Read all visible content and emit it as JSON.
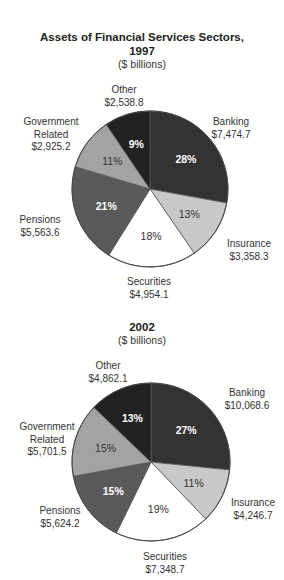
{
  "chart_data": [
    {
      "type": "pie",
      "title": "Assets of Financial Services Sectors, 1997",
      "subtitle": "($ billions)",
      "categories": [
        "Banking",
        "Insurance",
        "Securities",
        "Pensions",
        "Government Related",
        "Other"
      ],
      "values": [
        7474.7,
        3358.3,
        4954.1,
        5563.6,
        2925.2,
        2538.8
      ],
      "value_labels": [
        "$7,474.7",
        "$3,358.3",
        "$4,954.1",
        "$5,563.6",
        "$2,925.2",
        "$2,538.8"
      ],
      "percent_labels": [
        "28%",
        "13%",
        "18%",
        "21%",
        "11%",
        "9%"
      ],
      "colors": [
        "#333333",
        "#c8c8c8",
        "#ffffff",
        "#5a5a5a",
        "#a3a3a3",
        "#222222"
      ]
    },
    {
      "type": "pie",
      "title": "2002",
      "subtitle": "($ billions)",
      "categories": [
        "Banking",
        "Insurance",
        "Securities",
        "Pensions",
        "Government Related",
        "Other"
      ],
      "values": [
        10068.6,
        4246.7,
        7348.7,
        5624.2,
        5701.5,
        4862.1
      ],
      "value_labels": [
        "$10,068.6",
        "$4,246.7",
        "$7,348.7",
        "$5,624.2",
        "$5,701.5",
        "$4,862.1"
      ],
      "percent_labels": [
        "27%",
        "11%",
        "19%",
        "15%",
        "15%",
        "13%"
      ],
      "colors": [
        "#333333",
        "#c8c8c8",
        "#ffffff",
        "#5a5a5a",
        "#a3a3a3",
        "#222222"
      ]
    }
  ],
  "chart1": {
    "title_line1": "Assets of Financial Services Sectors,",
    "title_line2": "1997",
    "subtitle": "($ billions)",
    "labels": {
      "other": {
        "name": "Other",
        "value": "$2,538.8"
      },
      "banking": {
        "name": "Banking",
        "value": "$7,474.7"
      },
      "gov": {
        "name1": "Government",
        "name2": "Related",
        "value": "$2,925.2"
      },
      "pensions": {
        "name": "Pensions",
        "value": "$5,563.6"
      },
      "insurance": {
        "name": "Insurance",
        "value": "$3,358.3"
      },
      "securities": {
        "name": "Securities",
        "value": "$4,954.1"
      }
    },
    "pcts": {
      "banking": "28%",
      "insurance": "13%",
      "securities": "18%",
      "pensions": "21%",
      "gov": "11%",
      "other": "9%"
    }
  },
  "chart2": {
    "title": "2002",
    "subtitle": "($ billions)",
    "labels": {
      "other": {
        "name": "Other",
        "value": "$4,862.1"
      },
      "banking": {
        "name": "Banking",
        "value": "$10,068.6"
      },
      "gov": {
        "name1": "Government",
        "name2": "Related",
        "value": "$5,701.5"
      },
      "pensions": {
        "name": "Pensions",
        "value": "$5,624.2"
      },
      "insurance": {
        "name": "Insurance",
        "value": "$4,246.7"
      },
      "securities": {
        "name": "Securities",
        "value": "$7,348.7"
      }
    },
    "pcts": {
      "banking": "27%",
      "insurance": "11%",
      "securities": "19%",
      "pensions": "15%",
      "gov": "15%",
      "other": "13%"
    }
  }
}
